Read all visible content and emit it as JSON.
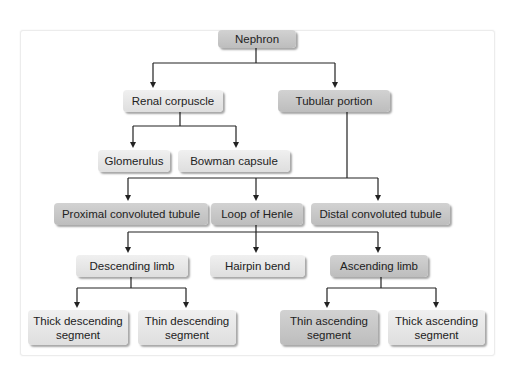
{
  "diagram": {
    "type": "flowchart",
    "root": "Nephron",
    "nodes": {
      "nephron": "Nephron",
      "renal_corpuscle": "Renal corpuscle",
      "tubular_portion": "Tubular portion",
      "glomerulus": "Glomerulus",
      "bowman_capsule": "Bowman capsule",
      "pct": "Proximal convoluted tubule",
      "loop_of_henle": "Loop of Henle",
      "dct": "Distal convoluted tubule",
      "descending_limb": "Descending limb",
      "hairpin_bend": "Hairpin bend",
      "ascending_limb": "Ascending limb",
      "thick_descending": "Thick descending segment",
      "thin_descending": "Thin descending segment",
      "thin_ascending": "Thin ascending segment",
      "thick_ascending": "Thick ascending segment"
    },
    "edges": [
      [
        "Nephron",
        "Renal corpuscle"
      ],
      [
        "Nephron",
        "Tubular portion"
      ],
      [
        "Renal corpuscle",
        "Glomerulus"
      ],
      [
        "Renal corpuscle",
        "Bowman capsule"
      ],
      [
        "Tubular portion",
        "Proximal convoluted tubule"
      ],
      [
        "Tubular portion",
        "Loop of Henle"
      ],
      [
        "Tubular portion",
        "Distal convoluted tubule"
      ],
      [
        "Loop of Henle",
        "Descending limb"
      ],
      [
        "Loop of Henle",
        "Hairpin bend"
      ],
      [
        "Loop of Henle",
        "Ascending limb"
      ],
      [
        "Descending limb",
        "Thick descending segment"
      ],
      [
        "Descending limb",
        "Thin descending segment"
      ],
      [
        "Ascending limb",
        "Thin ascending segment"
      ],
      [
        "Ascending limb",
        "Thick ascending segment"
      ]
    ],
    "colors": {
      "dark_box": "#c6c6c6",
      "light_box": "#e6e6e6",
      "line": "#222222",
      "text": "#222222"
    }
  }
}
